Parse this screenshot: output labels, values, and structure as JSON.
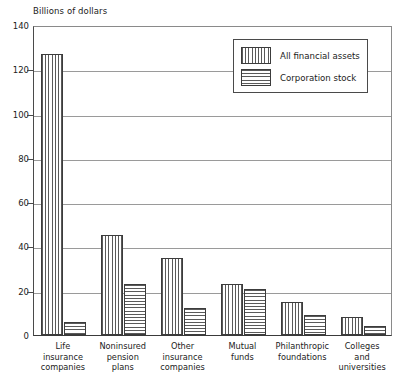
{
  "chart_data": {
    "type": "bar",
    "title": "",
    "ylabel": "Billions of dollars",
    "xlabel": "",
    "ylim": [
      0,
      140
    ],
    "yticks": [
      0,
      20,
      40,
      60,
      80,
      100,
      120,
      140
    ],
    "grid": true,
    "legend_position": "top-right",
    "categories": [
      "Life\ninsurance\ncompanies",
      "Noninsured\npension\nplans",
      "Other\ninsurance\ncompanies",
      "Mutual\nfunds",
      "Philanthropic\nfoundations",
      "Colleges\nand\nuniversities"
    ],
    "series": [
      {
        "name": "All financial assets",
        "pattern": "vertical-hatch",
        "values": [
          127,
          45,
          35,
          23,
          15,
          8
        ]
      },
      {
        "name": "Corporation stock",
        "pattern": "horizontal-hatch",
        "values": [
          6,
          23,
          12,
          21,
          9,
          4
        ]
      }
    ]
  },
  "colors": {
    "hatch": "#5a5a5a",
    "bar_outline": "#3c3c3c",
    "axis": "#3a3a3a",
    "gridline": "#9a9a9a",
    "text": "#1b1b1b",
    "background": "#ffffff"
  }
}
